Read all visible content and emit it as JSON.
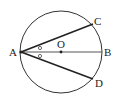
{
  "diagram": {
    "type": "circle-geometry",
    "circle": {
      "center_label": "O",
      "cx": 61,
      "cy": 52,
      "r": 41
    },
    "points": {
      "A": {
        "label": "A",
        "x": 21,
        "y": 52
      },
      "B": {
        "label": "B",
        "x": 102,
        "y": 52
      },
      "C": {
        "label": "C",
        "x": 93,
        "y": 24
      },
      "D": {
        "label": "D",
        "x": 93,
        "y": 79
      },
      "O": {
        "label": "O",
        "x": 61,
        "y": 52
      }
    },
    "segments": [
      "AB",
      "AC",
      "AD"
    ],
    "angle_marks": {
      "symbol": "○",
      "description": "angle CAB equals angle BAD"
    }
  }
}
